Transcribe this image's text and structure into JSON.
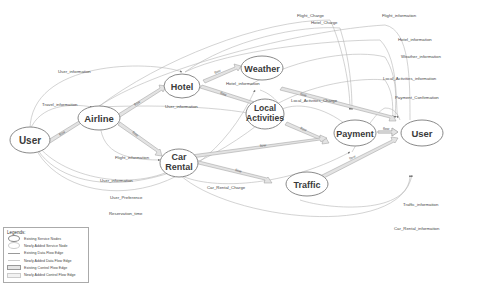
{
  "diagram": {
    "nodes": [
      {
        "id": "user_src",
        "label": "User"
      },
      {
        "id": "airline",
        "label": "Airline"
      },
      {
        "id": "hotel",
        "label": "Hotel"
      },
      {
        "id": "weather",
        "label": "Weather"
      },
      {
        "id": "local",
        "label_line1": "Local",
        "label_line2": "Activities"
      },
      {
        "id": "car",
        "label_line1": "Car",
        "label_line2": "Rental"
      },
      {
        "id": "payment",
        "label": "Payment"
      },
      {
        "id": "traffic",
        "label": "Traffic"
      },
      {
        "id": "user_dst",
        "label": "User"
      }
    ],
    "control_flow_label": "flow",
    "data_flows": [
      {
        "label": "User_information"
      },
      {
        "label": "Travel_information"
      },
      {
        "label": "User_information"
      },
      {
        "label": "Flight_information"
      },
      {
        "label": "User_information"
      },
      {
        "label": "User_Preference"
      },
      {
        "label": "Reservation_time"
      },
      {
        "label": "Hotel_information"
      },
      {
        "label": "Flight_Charge"
      },
      {
        "label": "Hotel_Charge"
      },
      {
        "label": "Flight_information"
      },
      {
        "label": "Hotel_information"
      },
      {
        "label": "Weather_information"
      },
      {
        "label": "Local_Activities_information"
      },
      {
        "label": "Local_Activities_Charge"
      },
      {
        "label": "Payment_Confirmation"
      },
      {
        "label": "Car_Rental_Charge"
      },
      {
        "label": "Traffic_information"
      },
      {
        "label": "Car_Rental_information"
      }
    ]
  },
  "legend": {
    "title": "Legends:",
    "items": [
      {
        "label": "Existing Service Nodes"
      },
      {
        "label": "Newly Added Service Node"
      },
      {
        "label": "Existing Data Flow Edge"
      },
      {
        "label": "Newly Added Data Flow Edge"
      },
      {
        "label": "Existing Control Flow Edge"
      },
      {
        "label": "Newly Added Control Flow Edge"
      }
    ]
  }
}
